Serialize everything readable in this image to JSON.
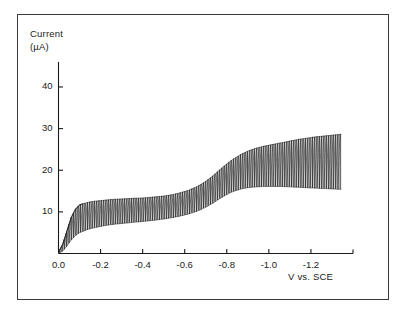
{
  "figure": {
    "background_color": "#ffffff",
    "border_color": "#3a3a3a",
    "trace_color": "#1a1a1a"
  },
  "chart_data": {
    "type": "line",
    "title": "",
    "subtitle": "",
    "xlabel": "V vs. SCE",
    "ylabel": "Current (µA)",
    "ylabel_line1": "Current",
    "ylabel_line2": "(µA)",
    "grid": false,
    "legend": null,
    "legend_position": "none",
    "xlim": [
      0.0,
      -1.4
    ],
    "ylim": [
      0,
      46
    ],
    "xticks": [
      0.0,
      -0.2,
      -0.4,
      -0.6,
      -0.8,
      -1.0,
      -1.2
    ],
    "xtick_labels": [
      "0.0",
      "-0.2",
      "-0.4",
      "-0.6",
      "-0.8",
      "-1.0",
      "-1.2"
    ],
    "yticks": [
      10,
      20,
      30,
      40
    ],
    "ytick_labels": [
      "10",
      "20",
      "30",
      "40"
    ],
    "oscillation_count": 122,
    "series": [
      {
        "name": "Envelope maximum (drop fall current)",
        "x": [
          0.0,
          -0.02,
          -0.04,
          -0.06,
          -0.08,
          -0.1,
          -0.14,
          -0.18,
          -0.22,
          -0.26,
          -0.3,
          -0.34,
          -0.38,
          -0.42,
          -0.46,
          -0.5,
          -0.54,
          -0.58,
          -0.62,
          -0.66,
          -0.7,
          -0.74,
          -0.78,
          -0.82,
          -0.86,
          -0.9,
          -0.94,
          -0.98,
          -1.02,
          -1.06,
          -1.1,
          -1.14,
          -1.18,
          -1.22,
          -1.26,
          -1.3,
          -1.34
        ],
        "values": [
          0.4,
          2.2,
          5.4,
          8.6,
          10.6,
          11.7,
          12.3,
          12.6,
          12.8,
          13.0,
          13.1,
          13.2,
          13.3,
          13.4,
          13.6,
          13.8,
          14.1,
          14.6,
          15.2,
          16.1,
          17.3,
          18.9,
          20.7,
          22.3,
          23.6,
          24.6,
          25.3,
          25.8,
          26.2,
          26.6,
          27.0,
          27.4,
          27.7,
          28.0,
          28.2,
          28.4,
          28.6
        ]
      },
      {
        "name": "Envelope minimum (drop birth current)",
        "x": [
          0.0,
          -0.02,
          -0.04,
          -0.06,
          -0.08,
          -0.1,
          -0.14,
          -0.18,
          -0.22,
          -0.26,
          -0.3,
          -0.34,
          -0.38,
          -0.42,
          -0.46,
          -0.5,
          -0.54,
          -0.58,
          -0.62,
          -0.66,
          -0.7,
          -0.74,
          -0.78,
          -0.82,
          -0.86,
          -0.9,
          -0.94,
          -0.98,
          -1.02,
          -1.06,
          -1.1,
          -1.14,
          -1.18,
          -1.22,
          -1.26,
          -1.3,
          -1.34
        ],
        "values": [
          0.0,
          0.6,
          1.8,
          3.2,
          4.3,
          5.0,
          5.8,
          6.3,
          6.7,
          7.0,
          7.2,
          7.4,
          7.6,
          7.8,
          8.0,
          8.3,
          8.6,
          9.0,
          9.5,
          10.2,
          11.1,
          12.3,
          13.6,
          14.7,
          15.4,
          15.8,
          16.0,
          16.1,
          16.1,
          16.1,
          16.0,
          15.9,
          15.8,
          15.7,
          15.6,
          15.5,
          15.4
        ]
      },
      {
        "name": "Envelope mid-line (mean current)",
        "x": [
          0.0,
          -0.02,
          -0.04,
          -0.06,
          -0.08,
          -0.1,
          -0.14,
          -0.18,
          -0.22,
          -0.26,
          -0.3,
          -0.34,
          -0.38,
          -0.42,
          -0.46,
          -0.5,
          -0.54,
          -0.58,
          -0.62,
          -0.66,
          -0.7,
          -0.74,
          -0.78,
          -0.82,
          -0.86,
          -0.9,
          -0.94,
          -0.98,
          -1.02,
          -1.06,
          -1.1,
          -1.14,
          -1.18,
          -1.22,
          -1.26,
          -1.3,
          -1.34
        ],
        "values": [
          0.2,
          1.4,
          3.6,
          5.9,
          7.5,
          8.4,
          9.1,
          9.5,
          9.8,
          10.0,
          10.2,
          10.3,
          10.5,
          10.6,
          10.8,
          11.1,
          11.4,
          11.8,
          12.4,
          13.2,
          14.2,
          15.6,
          17.2,
          18.5,
          19.5,
          20.2,
          20.7,
          21.0,
          21.2,
          21.4,
          21.5,
          21.7,
          21.8,
          21.9,
          21.9,
          22.0,
          22.0
        ]
      }
    ],
    "waves": [
      {
        "label": "wave 1",
        "half_wave_potential": -0.05,
        "limiting_current": 10.0
      },
      {
        "label": "wave 2",
        "half_wave_potential": -0.78,
        "limiting_current": 21.5
      }
    ]
  }
}
